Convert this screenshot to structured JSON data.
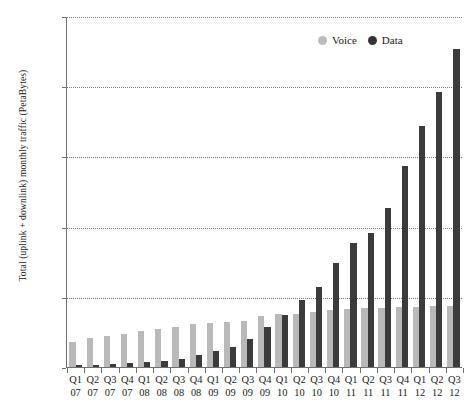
{
  "chart_data": {
    "type": "bar",
    "title": "",
    "subtitle": "",
    "xlabel": "",
    "ylabel": "Total (uplink + downlink) monthly traffic (PetaBytes)",
    "ylim": [
      0,
      1000
    ],
    "ytick_values": [
      0,
      200,
      400,
      600,
      800,
      1000
    ],
    "ytick_labels": [
      "0",
      "200",
      "400",
      "600",
      "800",
      "1,000"
    ],
    "grid": true,
    "legend_position": "top-right",
    "categories": [
      "Q1 07",
      "Q2 07",
      "Q3 07",
      "Q4 07",
      "Q1 08",
      "Q2 08",
      "Q3 08",
      "Q4 08",
      "Q1 09",
      "Q2 09",
      "Q3 09",
      "Q4 09",
      "Q1 10",
      "Q2 10",
      "Q3 10",
      "Q4 10",
      "Q1 11",
      "Q2 11",
      "Q3 11",
      "Q4 11",
      "Q1 12",
      "Q2 12",
      "Q3 12"
    ],
    "category_quarters": [
      "Q1",
      "Q2",
      "Q3",
      "Q4",
      "Q1",
      "Q2",
      "Q3",
      "Q4",
      "Q1",
      "Q2",
      "Q3",
      "Q4",
      "Q1",
      "Q2",
      "Q3",
      "Q4",
      "Q1",
      "Q2",
      "Q3",
      "Q4",
      "Q1",
      "Q2",
      "Q3"
    ],
    "category_years": [
      "07",
      "07",
      "07",
      "07",
      "08",
      "08",
      "08",
      "08",
      "09",
      "09",
      "09",
      "09",
      "10",
      "10",
      "10",
      "10",
      "11",
      "11",
      "11",
      "11",
      "12",
      "12",
      "12"
    ],
    "series": [
      {
        "name": "Voice",
        "color": "#b9b9b9",
        "values": [
          72,
          84,
          88,
          95,
          104,
          108,
          113,
          122,
          124,
          128,
          132,
          145,
          150,
          152,
          158,
          162,
          166,
          167,
          168,
          170,
          172,
          173,
          174
        ]
      },
      {
        "name": "Data",
        "color": "#3b3b3b",
        "values": [
          5,
          7,
          9,
          11,
          15,
          18,
          24,
          34,
          45,
          57,
          80,
          113,
          148,
          190,
          228,
          295,
          352,
          383,
          452,
          572,
          687,
          783,
          905
        ]
      }
    ]
  },
  "legend": {
    "items": [
      {
        "label": "Voice",
        "color": "#b9b9b9"
      },
      {
        "label": "Data",
        "color": "#3b3b3b"
      }
    ]
  }
}
